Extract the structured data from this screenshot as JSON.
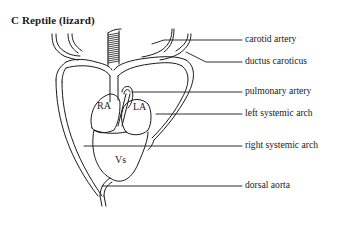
{
  "title": "C  Reptile (lizard)",
  "chambers": {
    "right_atrium": "RA",
    "left_atrium": "LA",
    "ventricle": "Vs"
  },
  "labels": [
    {
      "id": "carotid-artery",
      "text": "carotid artery"
    },
    {
      "id": "ductus-caroticus",
      "text": "ductus caroticus"
    },
    {
      "id": "pulmonary-artery",
      "text": "pulmonary artery"
    },
    {
      "id": "left-systemic-arch",
      "text": "left systemic arch"
    },
    {
      "id": "right-systemic-arch",
      "text": "right systemic arch"
    },
    {
      "id": "dorsal-aorta",
      "text": "dorsal aorta"
    }
  ],
  "colors": {
    "stroke": "#1a1a1a",
    "background": "#ffffff",
    "trachea_fill": "#8a8a8a"
  }
}
